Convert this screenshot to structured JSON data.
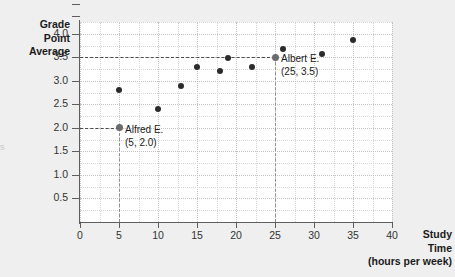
{
  "figure": {
    "edge_artifact": "s",
    "background_color": "#efefef",
    "plot_background_color": "#ffffff",
    "point_color": "#2b2b2b",
    "highlight_color": "#6b6b6b",
    "guide_color": "#4a4a4a"
  },
  "chart_data": {
    "type": "scatter",
    "title": "",
    "xlabel": "Study Time (hours per week)",
    "ylabel": "Grade Point Average",
    "xlabel_lines": [
      "Study",
      "Time",
      "(hours per week)"
    ],
    "ylabel_lines": [
      "Grade",
      "Point",
      "Average"
    ],
    "xlim": [
      0,
      40
    ],
    "ylim": [
      0,
      4.25
    ],
    "xticks": [
      0,
      5,
      10,
      15,
      20,
      25,
      30,
      35,
      40
    ],
    "xtick_labels": [
      "0",
      "5",
      "10",
      "15",
      "20",
      "25",
      "30",
      "35",
      "40"
    ],
    "yticks": [
      0.5,
      1.0,
      1.5,
      2.0,
      2.5,
      3.0,
      3.5,
      4.0
    ],
    "ytick_labels": [
      "0.5",
      "1.0",
      "1.5",
      "2.0",
      "2.5",
      "3.0",
      "3.5",
      "4.0"
    ],
    "grid": true,
    "grid_minor_step_x": 2.5,
    "grid_minor_step_y": 0.25,
    "legend": null,
    "points": [
      {
        "x": 5,
        "y": 2.0,
        "label": "Alfred E.",
        "highlight": true
      },
      {
        "x": 5,
        "y": 2.8,
        "label": "",
        "highlight": false
      },
      {
        "x": 10,
        "y": 2.4,
        "label": "",
        "highlight": false
      },
      {
        "x": 13,
        "y": 2.9,
        "label": "",
        "highlight": false
      },
      {
        "x": 15,
        "y": 3.3,
        "label": "",
        "highlight": false
      },
      {
        "x": 18,
        "y": 3.2,
        "label": "",
        "highlight": false
      },
      {
        "x": 19,
        "y": 3.48,
        "label": "",
        "highlight": false
      },
      {
        "x": 22,
        "y": 3.3,
        "label": "",
        "highlight": false
      },
      {
        "x": 25,
        "y": 3.5,
        "label": "Albert E.",
        "highlight": true
      },
      {
        "x": 26,
        "y": 3.68,
        "label": "",
        "highlight": false
      },
      {
        "x": 31,
        "y": 3.57,
        "label": "",
        "highlight": false
      },
      {
        "x": 35,
        "y": 3.87,
        "label": "",
        "highlight": false
      }
    ],
    "annotations": [
      {
        "name": "alfred",
        "name_text": "Alfred E.",
        "coord_text": "(5, 2.0)",
        "x": 5,
        "y": 2.0
      },
      {
        "name": "albert",
        "name_text": "Albert E.",
        "coord_text": "(25, 3.5)",
        "x": 25,
        "y": 3.5
      }
    ],
    "guides": [
      {
        "name": "alfred-horizontal",
        "orientation": "h",
        "value": 2.0
      },
      {
        "name": "alfred-vertical",
        "orientation": "v",
        "value": 5
      },
      {
        "name": "albert-horizontal",
        "orientation": "h",
        "value": 3.5
      },
      {
        "name": "albert-vertical",
        "orientation": "v",
        "value": 25
      }
    ]
  }
}
